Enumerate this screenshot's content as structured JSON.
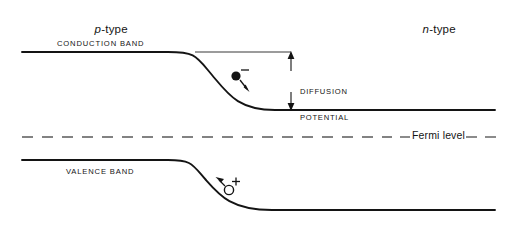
{
  "figure": {
    "type": "band-diagram",
    "width": 517,
    "height": 234,
    "background_color": "#ffffff",
    "line_color": "#141414",
    "text_color": "#141414"
  },
  "regions": {
    "left": {
      "italic_prefix": "p",
      "suffix": "-type",
      "full_text": "p-type"
    },
    "right": {
      "italic_prefix": "n",
      "suffix": "-type",
      "full_text": "n-type"
    }
  },
  "bands": {
    "conduction": {
      "label": "CONDUCTION BAND",
      "left_level_y": 52,
      "right_level_y": 110,
      "start_x": 22,
      "end_x": 495,
      "bend_start_x": 168,
      "bend_end_x": 275
    },
    "valence": {
      "label": "VALENCE BAND",
      "left_level_y": 160,
      "right_level_y": 210,
      "start_x": 22,
      "end_x": 495,
      "bend_start_x": 168,
      "bend_end_x": 272
    },
    "reference_line": {
      "name": "conduction-band-level-extension",
      "y": 52,
      "start_x": 195,
      "end_x": 291
    }
  },
  "annotations": {
    "diffusion_potential": {
      "line1": "DIFFUSION",
      "line2": "POTENTIAL",
      "arrow_x": 291,
      "arrow_top_y": 52,
      "arrow_bottom_y": 110
    },
    "fermi_level": {
      "label": "Fermi level",
      "y": 137,
      "dash_start_x": 22,
      "dash_end_x": 495
    },
    "electron": {
      "symbol": "−",
      "charge": "minus",
      "fill": "solid",
      "cx": 236,
      "cy": 76,
      "r": 4.6,
      "arrow_direction": "down-right"
    },
    "hole": {
      "symbol": "+",
      "charge": "plus",
      "fill": "open",
      "cx": 229,
      "cy": 190,
      "r": 4.6,
      "arrow_direction": "up-left"
    }
  }
}
